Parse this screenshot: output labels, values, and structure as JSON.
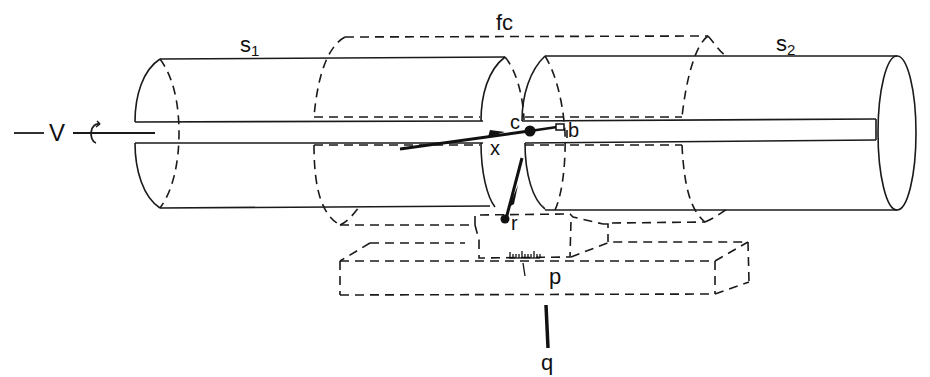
{
  "figure": {
    "type": "apparatus line drawing",
    "background": "#ffffff",
    "ink_color": "#1a1a1a"
  },
  "labels": {
    "s1": {
      "base": "s",
      "sub": "1"
    },
    "s2": {
      "base": "s",
      "sub": "2"
    },
    "fc": "fc",
    "v": "V",
    "c": "c",
    "b": "b",
    "x": "x",
    "r": "r",
    "p": "p",
    "q": "q"
  },
  "components": [
    {
      "id": "s1",
      "description": "left solid cylinder with axial slot",
      "style": "solid"
    },
    {
      "id": "s2",
      "description": "right solid cylinder with axial slot",
      "style": "solid"
    },
    {
      "id": "fc",
      "description": "dashed outer cylinder spanning the junction",
      "style": "dashed"
    },
    {
      "id": "V",
      "description": "axis with rotation arrow at left end",
      "style": "solid"
    },
    {
      "id": "x",
      "description": "arrow entering along slot toward point c",
      "style": "thick"
    },
    {
      "id": "c",
      "description": "filled dot at junction",
      "style": "filled"
    },
    {
      "id": "b",
      "description": "small open square on axis",
      "style": "open"
    },
    {
      "id": "r",
      "description": "arrow from c down to dot r",
      "style": "thick"
    },
    {
      "id": "p",
      "description": "dashed plate/box with scale ticks",
      "style": "dashed"
    },
    {
      "id": "q",
      "description": "vertical thick bar below plate",
      "style": "thick"
    }
  ]
}
